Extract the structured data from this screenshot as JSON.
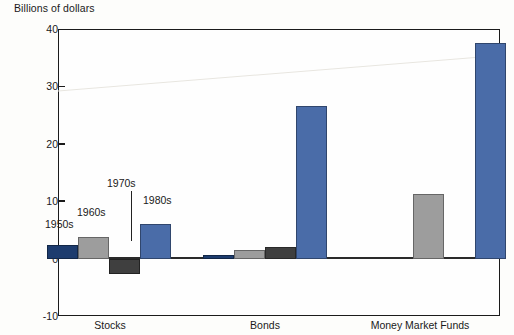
{
  "chart": {
    "ylabel": "Billions of dollars",
    "categories": [
      "Stocks",
      "Bonds",
      "Money Market Funds"
    ],
    "yticks": [
      "40",
      "30",
      "20",
      "10",
      "0",
      "-10"
    ],
    "decade_labels": [
      "1950s",
      "1960s",
      "1970s",
      "1980s"
    ]
  },
  "chart_data": {
    "type": "bar",
    "title": "",
    "xlabel": "",
    "ylabel": "Billions of dollars",
    "ylim": [
      -10,
      40
    ],
    "yticks": [
      -10,
      0,
      10,
      20,
      30,
      40
    ],
    "grid": false,
    "legend": "inline annotations above bars",
    "categories": [
      "Stocks",
      "Bonds",
      "Money Market Funds"
    ],
    "series": [
      {
        "name": "1950s",
        "color": "#1d3c6e",
        "values": [
          2.4,
          0.7,
          null
        ]
      },
      {
        "name": "1960s",
        "color": "#9d9d9d",
        "values": [
          3.8,
          1.5,
          11.2
        ]
      },
      {
        "name": "1970s",
        "color": "#3f3f3f",
        "values": [
          -2.6,
          2.0,
          null
        ]
      },
      {
        "name": "1980s",
        "color": "#4a6ca8",
        "values": [
          6.1,
          26.5,
          37.6
        ]
      }
    ],
    "annotations": [
      {
        "text": "1950s",
        "target": "Stocks/1950s"
      },
      {
        "text": "1960s",
        "target": "Stocks/1960s"
      },
      {
        "text": "1970s",
        "target": "Stocks/1970s",
        "leader_line": true
      },
      {
        "text": "1980s",
        "target": "Stocks/1980s"
      }
    ]
  },
  "colors": {
    "navy": "#1d3c6e",
    "light_gray": "#9d9d9d",
    "dark_gray": "#3f3f3f",
    "steel_blue": "#4a6ca8",
    "axis": "#1b1b1b",
    "background": "#fdfdfb"
  }
}
